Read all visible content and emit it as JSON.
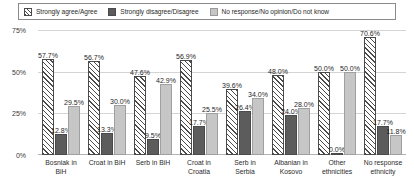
{
  "legend": {
    "position": "top",
    "items": [
      {
        "label": "Strongly agree/Agree",
        "swatch": "hatch-icon",
        "color": "#ffffff"
      },
      {
        "label": "Strongly disagree/Disagree",
        "swatch": "solid-dark-icon",
        "color": "#5c5c5c"
      },
      {
        "label": "No response/No opinion/Do not know",
        "swatch": "solid-light-icon",
        "color": "#c6c6c6"
      }
    ]
  },
  "yaxis": {
    "ticks": [
      "75%",
      "50%",
      "25%",
      "0%"
    ],
    "values": [
      75,
      50,
      25,
      0
    ]
  },
  "chart_data": {
    "type": "bar",
    "title": "",
    "subtitle": "",
    "xlabel": "",
    "ylabel": "",
    "ylim": [
      0,
      75
    ],
    "grid": true,
    "legend_position": "top",
    "categories": [
      "Bosniak in BiH",
      "Croat in BiH",
      "Serb in BiH",
      "Croat in Croatia",
      "Serb in Serbia",
      "Albanian in Kosovo",
      "Other ethnicities",
      "No response ethnicity"
    ],
    "series": [
      {
        "name": "Strongly agree/Agree",
        "values": [
          57.7,
          56.7,
          47.6,
          56.9,
          39.6,
          48.0,
          50.0,
          70.6
        ],
        "labels": [
          "57.7%",
          "56.7%",
          "47.6%",
          "56.9%",
          "39.6%",
          "48.0%",
          "50.0%",
          "70.6%"
        ]
      },
      {
        "name": "Strongly disagree/Disagree",
        "values": [
          12.8,
          13.3,
          9.5,
          17.7,
          26.4,
          24.0,
          0.0,
          17.7
        ],
        "labels": [
          "12.8%",
          "13.3%",
          "9.5%",
          "17.7%",
          "26.4%",
          "24.0%",
          "0.0%",
          "17.7%"
        ]
      },
      {
        "name": "No response/No opinion/Do not know",
        "values": [
          29.5,
          30.0,
          42.9,
          25.5,
          34.0,
          28.0,
          50.0,
          11.8
        ],
        "labels": [
          "29.5%",
          "30.0%",
          "42.9%",
          "25.5%",
          "34.0%",
          "28.0%",
          "50.0%",
          "11.8%"
        ]
      }
    ]
  },
  "xlabels_wrapped": [
    [
      "Bosniak in",
      "BiH"
    ],
    [
      "Croat in BiH",
      ""
    ],
    [
      "Serb in BiH",
      ""
    ],
    [
      "Croat in",
      "Croatia"
    ],
    [
      "Serb in",
      "Serbia"
    ],
    [
      "Albanian in",
      "Kosovo"
    ],
    [
      "Other",
      "ethnicities"
    ],
    [
      "No response",
      "ethnicity"
    ]
  ]
}
